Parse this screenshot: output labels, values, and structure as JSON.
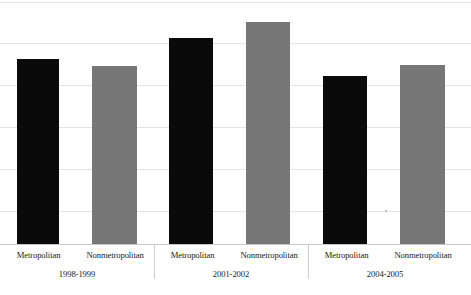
{
  "chart_data": {
    "type": "bar",
    "title": "",
    "subtitle": "",
    "xlabel": "",
    "ylabel": "",
    "ylim": [
      0,
      58
    ],
    "grid": true,
    "gridline_interval": 10,
    "legend_position": "none",
    "categories": [
      "1998-1999",
      "2001-2002",
      "2004-2005"
    ],
    "series": [
      {
        "name": "Metropolitan",
        "color": "#0a0a0a",
        "values": [
          44.0,
          49.0,
          40.0
        ]
      },
      {
        "name": "Nonmetropolitan",
        "color": "#777777",
        "values": [
          42.4,
          52.9,
          42.6
        ]
      }
    ],
    "bars": [
      {
        "group": "1998-1999",
        "series": "Metropolitan",
        "value": 44.0,
        "color": "#0a0a0a"
      },
      {
        "group": "1998-1999",
        "series": "Nonmetropolitan",
        "value": 42.4,
        "color": "#777777"
      },
      {
        "group": "2001-2002",
        "series": "Metropolitan",
        "value": 49.0,
        "color": "#0a0a0a"
      },
      {
        "group": "2001-2002",
        "series": "Nonmetropolitan",
        "value": 52.9,
        "color": "#777777"
      },
      {
        "group": "2004-2005",
        "series": "Metropolitan",
        "value": 40.0,
        "color": "#0a0a0a"
      },
      {
        "group": "2004-2005",
        "series": "Nonmetropolitan",
        "value": 42.6,
        "color": "#777777"
      }
    ],
    "tick_labels": []
  },
  "axis": {
    "series_labels": [
      "Metropolitan",
      "Nonmetropolitan",
      "Metropolitan",
      "Nonmetropolitan",
      "Metropolitan",
      "Nonmetropolitan"
    ],
    "group_labels": [
      "1998-1999",
      "2001-2002",
      "2004-2005"
    ]
  },
  "colors": {
    "metropolitan": "#0a0a0a",
    "nonmetropolitan": "#777777",
    "gridline": "#e3e3e3",
    "background": "#ffffff",
    "separator": "#cfcfcf"
  }
}
